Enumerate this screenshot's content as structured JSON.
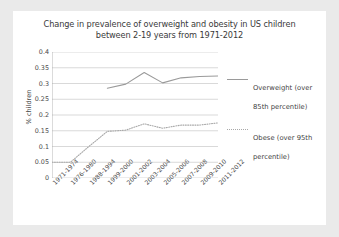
{
  "chart_data": {
    "type": "line",
    "title": "Change in prevalence of overweight and obesity in US children between 2-19 years from 1971-2012",
    "title_line1": "Change in prevalence of overweight and obesity in US children",
    "title_line2": "between 2-19 years from 1971-2012",
    "xlabel": "",
    "ylabel": "% children",
    "ylim": [
      0,
      0.4
    ],
    "yticks": [
      "0",
      "0.05",
      "0.1",
      "0.15",
      "0.2",
      "0.25",
      "0.3",
      "0.35",
      "0.4"
    ],
    "ytick_values": [
      0,
      0.05,
      0.1,
      0.15,
      0.2,
      0.25,
      0.3,
      0.35,
      0.4
    ],
    "grid": true,
    "legend_position": "right",
    "categories": [
      "1971-1974",
      "1976-1980",
      "1988-1994",
      "1999-2000",
      "2001-2002",
      "2003-2004",
      "2005-2006",
      "2007-2008",
      "2009-2010",
      "2011-2012"
    ],
    "series": [
      {
        "name": "Overweight (over 85th percentile)",
        "name_line1": "Overweight (over",
        "name_line2": "85th percentile)",
        "style": "solid",
        "color": "#9a9a9a",
        "values": [
          null,
          null,
          null,
          0.285,
          0.298,
          0.335,
          0.302,
          0.318,
          0.322,
          0.324
        ]
      },
      {
        "name": "Obese (over 95th percentile)",
        "name_line1": "Obese (over 95th",
        "name_line2": "percentile)",
        "style": "dotted",
        "color": "#a8a8a8",
        "values": [
          0.05,
          0.05,
          0.1,
          0.148,
          0.152,
          0.172,
          0.158,
          0.168,
          0.168,
          0.175
        ]
      }
    ]
  }
}
